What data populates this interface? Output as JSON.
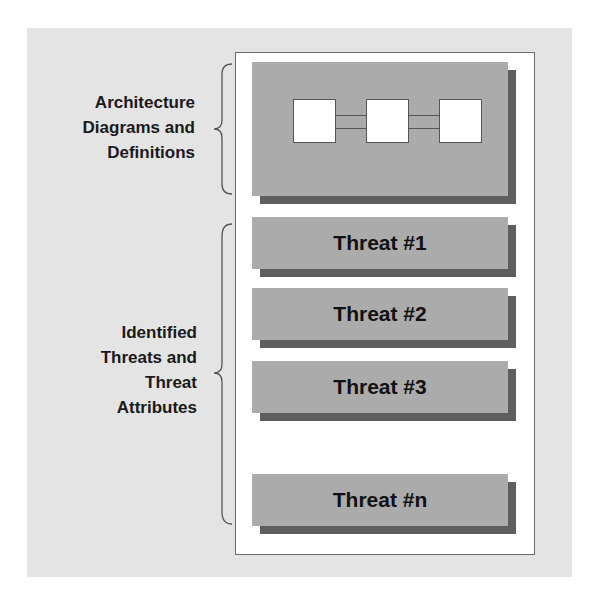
{
  "diagram": {
    "sections": [
      {
        "id": "architecture",
        "label_lines": [
          "Architecture",
          "Diagrams and",
          "Definitions"
        ]
      },
      {
        "id": "threats",
        "label_lines": [
          "Identified",
          "Threats and",
          "Threat",
          "Attributes"
        ]
      }
    ],
    "architecture_card": {
      "boxes": 3,
      "connectors": 2
    },
    "threat_cards": [
      {
        "label": "Threat #1"
      },
      {
        "label": "Threat #2"
      },
      {
        "label": "Threat #3"
      },
      {
        "label": "Threat #n"
      }
    ],
    "colors": {
      "background": "#e4e4e4",
      "panel": "#ffffff",
      "card": "#ababab",
      "card_shadow": "#5e5e5e",
      "text": "#111111"
    }
  }
}
